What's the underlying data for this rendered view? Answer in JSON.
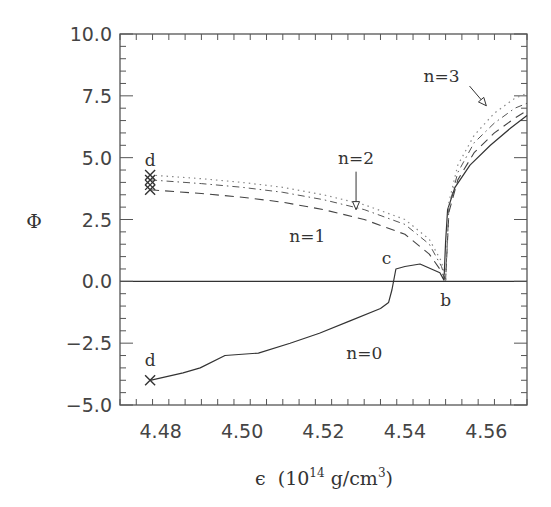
{
  "chart_data": {
    "type": "line",
    "title": "",
    "xlabel": "ϵ (10^14 g/cm^3)",
    "xlabel_parts": {
      "symbol": "ϵ",
      "open": "(10",
      "exp": "14",
      "unit": " g/cm",
      "unit_exp": "3",
      "close": ")"
    },
    "ylabel": "Φ",
    "xlim": [
      4.47,
      4.57
    ],
    "ylim": [
      -5.0,
      10.0
    ],
    "x_ticks": [
      "4.48",
      "4.50",
      "4.52",
      "4.54",
      "4.56"
    ],
    "y_ticks": [
      "10.0",
      "7.5",
      "5.0",
      "2.5",
      "0.0",
      "-2.5",
      "-5.0"
    ],
    "grid": false,
    "legend": "none (curves labeled inline)",
    "series": [
      {
        "name": "n=0",
        "style": "solid",
        "x": [
          4.4774,
          4.4855,
          4.4897,
          4.4958,
          4.504,
          4.5118,
          4.519,
          4.5265,
          4.534,
          4.536,
          4.5368,
          4.5378,
          4.54,
          4.5437,
          4.5486,
          4.5496,
          4.55,
          4.5505,
          4.5523,
          4.556,
          4.561,
          4.566,
          4.57
        ],
        "y": [
          -4.0,
          -3.7,
          -3.5,
          -3.0,
          -2.9,
          -2.5,
          -2.1,
          -1.6,
          -1.1,
          -0.85,
          -0.35,
          0.5,
          0.6,
          0.7,
          0.35,
          0.05,
          1.6,
          2.9,
          3.8,
          4.7,
          5.5,
          6.2,
          6.7
        ]
      },
      {
        "name": "n=1",
        "style": "dashed",
        "x": [
          4.4774,
          4.49,
          4.5,
          4.51,
          4.52,
          4.53,
          4.54,
          4.546,
          4.549,
          4.55,
          4.5508,
          4.553,
          4.557,
          4.562,
          4.567,
          4.57
        ],
        "y": [
          3.7,
          3.55,
          3.4,
          3.2,
          2.9,
          2.5,
          1.9,
          1.1,
          0.4,
          0.05,
          2.8,
          4.1,
          5.2,
          6.0,
          6.6,
          6.9
        ]
      },
      {
        "name": "n=2",
        "style": "dash-dot",
        "x": [
          4.4774,
          4.49,
          4.5,
          4.51,
          4.52,
          4.53,
          4.54,
          4.546,
          4.549,
          4.55,
          4.5508,
          4.553,
          4.557,
          4.562,
          4.567,
          4.57
        ],
        "y": [
          4.1,
          3.95,
          3.8,
          3.6,
          3.3,
          2.9,
          2.3,
          1.5,
          0.6,
          0.05,
          3.0,
          4.4,
          5.6,
          6.4,
          7.0,
          7.2
        ]
      },
      {
        "name": "n=3",
        "style": "dotted",
        "x": [
          4.4774,
          4.49,
          4.5,
          4.51,
          4.52,
          4.53,
          4.54,
          4.546,
          4.549,
          4.55,
          4.5508,
          4.553,
          4.557,
          4.562,
          4.567,
          4.57
        ],
        "y": [
          4.3,
          4.15,
          4.0,
          3.8,
          3.5,
          3.1,
          2.5,
          1.7,
          0.8,
          0.05,
          3.2,
          4.7,
          5.9,
          6.8,
          7.4,
          7.6
        ]
      }
    ],
    "markers": [
      {
        "label": "d",
        "symbol": "×",
        "x": 4.4774,
        "y": -4.0
      },
      {
        "label": "d",
        "symbol": "×",
        "x": 4.4774,
        "y": 4.3
      },
      {
        "label": "",
        "symbol": "×",
        "x": 4.4774,
        "y": 4.1
      },
      {
        "label": "",
        "symbol": "×",
        "x": 4.4774,
        "y": 3.9
      },
      {
        "label": "",
        "symbol": "×",
        "x": 4.4774,
        "y": 3.7
      }
    ],
    "annotations": [
      {
        "text": "n=3",
        "x": 4.549,
        "y": 8.3,
        "arrow_to": [
          4.56,
          7.1
        ]
      },
      {
        "text": "n=2",
        "x": 4.528,
        "y": 5.0,
        "arrow_to": [
          4.528,
          2.9
        ]
      },
      {
        "text": "n=1",
        "x": 4.516,
        "y": 1.85
      },
      {
        "text": "n=0",
        "x": 4.53,
        "y": -2.9
      },
      {
        "text": "c",
        "x": 4.5355,
        "y": 0.95
      },
      {
        "text": "b",
        "x": 4.55,
        "y": -0.75
      },
      {
        "text": "d",
        "x": 4.4774,
        "y": 4.9
      },
      {
        "text": "d",
        "x": 4.4774,
        "y": -3.2
      }
    ],
    "reference_lines": [
      {
        "orientation": "horizontal",
        "y": 0.0,
        "style": "solid"
      }
    ]
  },
  "colors": {
    "axis": "#555555",
    "line": "#333333",
    "dotted": "#888888"
  }
}
